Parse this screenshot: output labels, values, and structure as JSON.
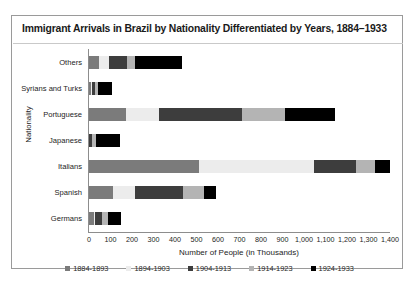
{
  "chart_data": {
    "type": "bar",
    "orientation": "horizontal",
    "stacked": true,
    "title": "Immigrant Arrivals in Brazil by Nationality Differentiated by Years, 1884–1933",
    "xlabel": "Number of People (in Thousands)",
    "ylabel": "Nationality",
    "categories": [
      "Others",
      "Syrians and Turks",
      "Portuguese",
      "Japanese",
      "Italians",
      "Spanish",
      "Germans"
    ],
    "series": [
      {
        "name": "1884-1893",
        "color": "#7b7b7b",
        "values": [
          48,
          10,
          170,
          1,
          510,
          113,
          22
        ]
      },
      {
        "name": "1894-1903",
        "color": "#ececec",
        "values": [
          45,
          2,
          155,
          0,
          537,
          102,
          6
        ]
      },
      {
        "name": "1904-1913",
        "color": "#3d3d3d",
        "values": [
          85,
          16,
          385,
          12,
          196,
          224,
          33
        ]
      },
      {
        "name": "1914-1923",
        "color": "#b4b4b4",
        "values": [
          38,
          15,
          200,
          21,
          86,
          94,
          29
        ]
      },
      {
        "name": "1924-1933",
        "color": "#000000",
        "values": [
          219,
          64,
          234,
          110,
          71,
          60,
          61
        ]
      }
    ],
    "xticks": [
      "0",
      "100",
      "200",
      "300",
      "400",
      "500",
      "600",
      "700",
      "800",
      "900",
      "1,000",
      "1,100",
      "1,200",
      "1,300",
      "1,400"
    ],
    "xlim": [
      0,
      1400
    ],
    "grid": false,
    "legend_position": "bottom"
  },
  "figure": {
    "background_color": "#ffffff",
    "border_color": "#9a9a9a"
  }
}
